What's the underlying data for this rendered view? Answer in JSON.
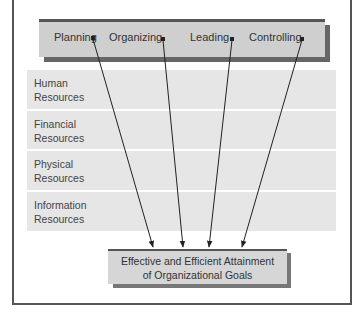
{
  "diagram": {
    "functions": [
      {
        "label": "Planning",
        "x": 54,
        "dot": [
          93,
          38
        ]
      },
      {
        "label": "Organizing",
        "x": 109,
        "dot": [
          163,
          39
        ]
      },
      {
        "label": "Leading",
        "x": 190,
        "dot": [
          232,
          39
        ]
      },
      {
        "label": "Controlling",
        "x": 249,
        "dot": [
          302,
          39
        ]
      }
    ],
    "resources": [
      {
        "line1": "Human",
        "line2": "Resources"
      },
      {
        "line1": "Financial",
        "line2": "Resources"
      },
      {
        "line1": "Physical",
        "line2": "Resources"
      },
      {
        "line1": "Information",
        "line2": "Resources"
      }
    ],
    "goal": {
      "line1": "Effective and Efficient Attainment",
      "line2": "of Organizational Goals"
    },
    "arrow_targets": [
      [
        153,
        247
      ],
      [
        183,
        247
      ],
      [
        209,
        247
      ],
      [
        242,
        247
      ]
    ],
    "colors": {
      "top_box": "#cfcfcf",
      "resource_band": "#e6e6e6",
      "goal_box": "#d6d6d6",
      "shadow": "#666666",
      "line": "#222222"
    }
  }
}
